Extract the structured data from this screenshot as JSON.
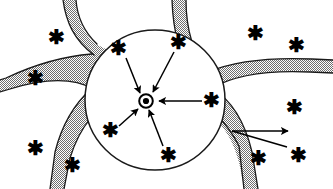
{
  "figure": {
    "width": 333,
    "height": 189,
    "background_color": "#ffffff",
    "stroke_color": "#000000",
    "hatch_color": "#808080",
    "hatch_label": "stippled-gray-50-percent"
  },
  "pore": {
    "name": "central-white-pore",
    "shape": "circle",
    "center_x": 155,
    "center_y": 100,
    "radius": 70,
    "fill": "#ffffff",
    "stroke_width": 1.4
  },
  "matrix": {
    "name": "hatched-solid-matrix",
    "description": "stippled gray region surrounding the pore with concave lobes",
    "fill_pattern": "checker-dither",
    "pattern_color": "#7a7a7a"
  },
  "nucleus": {
    "name": "central-nucleus",
    "center_x": 146,
    "center_y": 101,
    "outer_radius": 7.5,
    "inner_radius": 3.2,
    "ring_width": 1.8,
    "fill": "#000000"
  },
  "asterisks": [
    {
      "id": "ast-inner-upper-left",
      "x": 118,
      "y": 48,
      "size": 20,
      "region": "inside-pore"
    },
    {
      "id": "ast-inner-upper-right",
      "x": 178,
      "y": 42,
      "size": 20,
      "region": "inside-pore"
    },
    {
      "id": "ast-inner-right",
      "x": 211,
      "y": 100,
      "size": 20,
      "region": "inside-pore"
    },
    {
      "id": "ast-inner-lower-left",
      "x": 110,
      "y": 130,
      "size": 20,
      "region": "inside-pore"
    },
    {
      "id": "ast-inner-lower",
      "x": 168,
      "y": 155,
      "size": 20,
      "region": "inside-pore"
    },
    {
      "id": "ast-outer-top-left",
      "x": 56,
      "y": 37,
      "size": 20,
      "region": "outside-matrix"
    },
    {
      "id": "ast-outer-left",
      "x": 35,
      "y": 78,
      "size": 20,
      "region": "outside-matrix"
    },
    {
      "id": "ast-outer-bottom-left",
      "x": 35,
      "y": 148,
      "size": 20,
      "region": "outside-matrix"
    },
    {
      "id": "ast-outer-bottom-left2",
      "x": 72,
      "y": 165,
      "size": 20,
      "region": "outside-matrix"
    },
    {
      "id": "ast-outer-top-right",
      "x": 255,
      "y": 33,
      "size": 20,
      "region": "outside-matrix"
    },
    {
      "id": "ast-outer-right-upper",
      "x": 296,
      "y": 45,
      "size": 20,
      "region": "outside-matrix"
    },
    {
      "id": "ast-outer-right-mid",
      "x": 294,
      "y": 107,
      "size": 20,
      "region": "outside-matrix"
    },
    {
      "id": "ast-outer-bottom-right",
      "x": 258,
      "y": 158,
      "size": 20,
      "region": "outside-matrix"
    },
    {
      "id": "ast-outer-far-bottom-right",
      "x": 298,
      "y": 155,
      "size": 20,
      "region": "outside-matrix"
    }
  ],
  "arrows": [
    {
      "id": "arrow-from-upper-left",
      "x1": 126,
      "y1": 58,
      "x2": 140,
      "y2": 93,
      "head": "end",
      "direction": "toward-nucleus"
    },
    {
      "id": "arrow-from-upper-right",
      "x1": 174,
      "y1": 52,
      "x2": 153,
      "y2": 92,
      "head": "end",
      "direction": "toward-nucleus"
    },
    {
      "id": "arrow-from-right",
      "x1": 202,
      "y1": 101,
      "x2": 158,
      "y2": 101,
      "head": "end",
      "direction": "toward-nucleus"
    },
    {
      "id": "arrow-from-lower-left",
      "x1": 119,
      "y1": 126,
      "x2": 138,
      "y2": 109,
      "head": "end",
      "direction": "toward-nucleus"
    },
    {
      "id": "arrow-from-lower",
      "x1": 163,
      "y1": 146,
      "x2": 149,
      "y2": 110,
      "head": "end",
      "direction": "toward-nucleus"
    },
    {
      "id": "arrow-outward-right",
      "x1": 232,
      "y1": 131,
      "x2": 290,
      "y2": 131,
      "head": "end",
      "direction": "outward"
    },
    {
      "id": "arrow-outward-to-asterisk",
      "x1": 232,
      "y1": 131,
      "x2": 288,
      "y2": 148,
      "head": "none",
      "direction": "outward"
    }
  ]
}
